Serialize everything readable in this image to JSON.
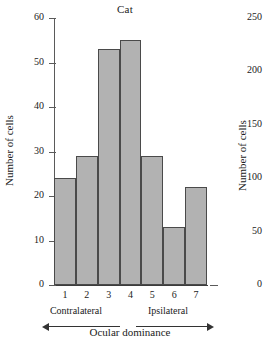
{
  "figure": {
    "background": "#ffffff",
    "bar_fill": "#b2b2b2",
    "bar_stroke": "#4a4a4a",
    "axis_color": "#5a5a5a"
  },
  "main": {
    "title": "Cat",
    "ylabel": "Number of cells",
    "xlabel": "Ocular dominance",
    "group_left": "Contralateral",
    "group_right": "Ipsilateral"
  },
  "right_panel": {
    "ylabel": "Number of cells"
  },
  "chart_data": [
    {
      "type": "bar",
      "title": "Cat",
      "xlabel": "Ocular dominance",
      "ylabel": "Number of cells",
      "categories": [
        "1",
        "2",
        "3",
        "4",
        "5",
        "6",
        "7"
      ],
      "values": [
        24,
        29,
        53,
        55,
        29,
        13,
        22
      ],
      "ylim": [
        0,
        60
      ],
      "yticks": [
        0,
        10,
        20,
        30,
        40,
        50,
        60
      ],
      "ytick_labels": [
        "0",
        "10",
        "20",
        "30",
        "40",
        "50",
        "60"
      ],
      "xtick_labels": [
        "1",
        "2",
        "3",
        "4",
        "5",
        "6",
        "7"
      ],
      "grid": false,
      "legend": null,
      "annotations": [
        {
          "text": "Contralateral",
          "covers": [
            "1",
            "2",
            "3"
          ],
          "arrow": "left"
        },
        {
          "text": "Ipsilateral",
          "covers": [
            "5",
            "6",
            "7"
          ],
          "arrow": "right"
        }
      ]
    },
    {
      "type": "bar",
      "title": "",
      "ylabel": "Number of cells",
      "ylim": [
        0,
        250
      ],
      "yticks": [
        0,
        50,
        100,
        150,
        200,
        250
      ],
      "ytick_labels": [
        "0",
        "50",
        "100",
        "150",
        "200",
        "250"
      ],
      "note": "partially visible adjacent panel; only y-axis tick labels and axis label are rendered in the screenshot",
      "categories": [],
      "values": []
    }
  ]
}
